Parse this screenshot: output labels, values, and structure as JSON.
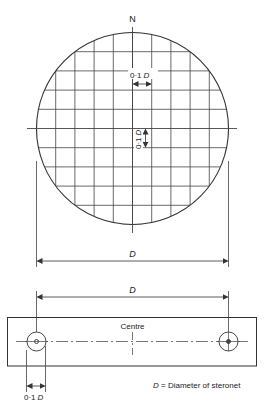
{
  "figure": {
    "north_label": "N",
    "grid_spacing_label": "0·1",
    "grid_spacing_var": "D",
    "diameter_label": "D",
    "centre_label": "Centre",
    "hole_offset_label": "0·1",
    "hole_offset_var": "D",
    "legend_var": "D",
    "legend_text": " = Diameter of steronet"
  },
  "colors": {
    "line": "#333333",
    "background": "#ffffff"
  }
}
